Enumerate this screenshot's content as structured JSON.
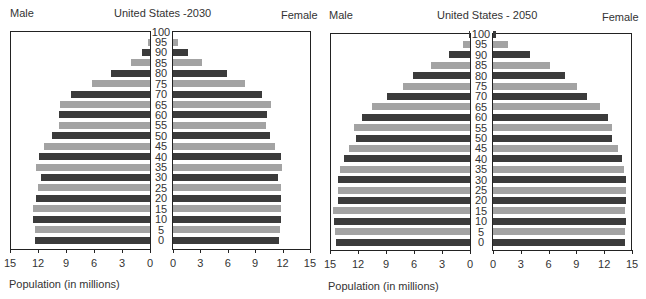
{
  "chart_data": [
    {
      "type": "bar",
      "subtype": "population-pyramid",
      "title": "United States -2030",
      "left_label": "Male",
      "right_label": "Female",
      "xlabel": "Population (in millions)",
      "ylabel": "Age",
      "xlim": [
        0,
        15
      ],
      "x_ticks": [
        0,
        3,
        6,
        9,
        12,
        15
      ],
      "categories": [
        "0",
        "5",
        "10",
        "15",
        "20",
        "25",
        "30",
        "35",
        "40",
        "45",
        "50",
        "55",
        "60",
        "65",
        "70",
        "75",
        "80",
        "85",
        "90",
        "95",
        "100"
      ],
      "series": [
        {
          "name": "Male",
          "values": [
            12.3,
            12.3,
            12.5,
            12.5,
            12.2,
            12.0,
            11.7,
            12.2,
            11.9,
            11.4,
            10.5,
            9.8,
            9.7,
            9.6,
            8.5,
            6.2,
            4.2,
            2.0,
            0.9,
            0.2,
            0.0
          ]
        },
        {
          "name": "Female",
          "values": [
            11.6,
            11.7,
            11.8,
            11.8,
            11.8,
            11.8,
            11.5,
            11.9,
            11.8,
            11.2,
            10.6,
            10.2,
            10.3,
            10.7,
            9.8,
            7.9,
            5.9,
            3.2,
            1.6,
            0.5,
            0.0
          ]
        }
      ],
      "grid": false,
      "bar_colors": {
        "dark": "#3b3b3b",
        "light": "#a3a3a3"
      }
    },
    {
      "type": "bar",
      "subtype": "population-pyramid",
      "title": "United States - 2050",
      "left_label": "Male",
      "right_label": "Female",
      "xlabel": "Population (in millions)",
      "ylabel": "Age",
      "xlim": [
        0,
        15
      ],
      "x_ticks": [
        0,
        3,
        6,
        9,
        12,
        15
      ],
      "categories": [
        "0",
        "5",
        "10",
        "15",
        "20",
        "25",
        "30",
        "35",
        "40",
        "45",
        "50",
        "55",
        "60",
        "65",
        "70",
        "75",
        "80",
        "85",
        "90",
        "95",
        "100"
      ],
      "series": [
        {
          "name": "Male",
          "values": [
            14.4,
            14.5,
            14.6,
            14.7,
            14.2,
            14.2,
            14.2,
            13.9,
            13.5,
            13.0,
            12.2,
            12.4,
            11.6,
            10.5,
            8.9,
            7.2,
            6.1,
            4.2,
            2.3,
            0.7,
            0.1
          ]
        },
        {
          "name": "Female",
          "values": [
            14.2,
            14.2,
            14.4,
            14.2,
            14.3,
            14.4,
            14.4,
            14.1,
            13.9,
            13.5,
            12.8,
            12.8,
            12.4,
            11.5,
            10.1,
            9.1,
            7.8,
            6.1,
            4.0,
            1.6,
            0.3
          ]
        }
      ],
      "grid": false,
      "bar_colors": {
        "dark": "#3b3b3b",
        "light": "#a3a3a3"
      }
    }
  ],
  "charts": [
    {
      "title": "United States -2030",
      "male": "Male",
      "female": "Female",
      "xlabel": "Population (in millions)"
    },
    {
      "title": "United States - 2050",
      "male": "Male",
      "female": "Female",
      "xlabel": "Population (in millions)"
    }
  ]
}
